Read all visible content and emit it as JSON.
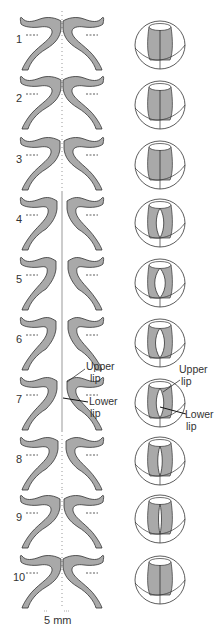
{
  "figure": {
    "colors": {
      "fill": "#a9a9a9",
      "stroke": "#333333",
      "background": "#ffffff"
    },
    "stages": [
      {
        "num": "1",
        "gap": 0,
        "state": "closed",
        "slit": 0
      },
      {
        "num": "2",
        "gap": 0,
        "state": "closed",
        "slit": 0
      },
      {
        "num": "3",
        "gap": 1,
        "state": "closed",
        "slit": 0
      },
      {
        "num": "4",
        "gap": 4,
        "state": "open",
        "slit": 5
      },
      {
        "num": "5",
        "gap": 5,
        "state": "open",
        "slit": 7
      },
      {
        "num": "6",
        "gap": 5,
        "state": "open",
        "slit": 6
      },
      {
        "num": "7",
        "gap": 4,
        "state": "open",
        "slit": 5
      },
      {
        "num": "8",
        "gap": 3,
        "state": "closing",
        "slit": 3
      },
      {
        "num": "9",
        "gap": 1,
        "state": "closing",
        "slit": 2
      },
      {
        "num": "10",
        "gap": 0,
        "state": "closed",
        "slit": 0
      }
    ],
    "annotations": {
      "left_upper": "Upper",
      "left_upper2": "lip",
      "left_lower": "Lower",
      "left_lower2": "lip",
      "right_upper": "Upper",
      "right_upper2": "lip",
      "right_lower": "Lower",
      "right_lower2": "lip"
    },
    "scale_bar": "5 mm"
  }
}
